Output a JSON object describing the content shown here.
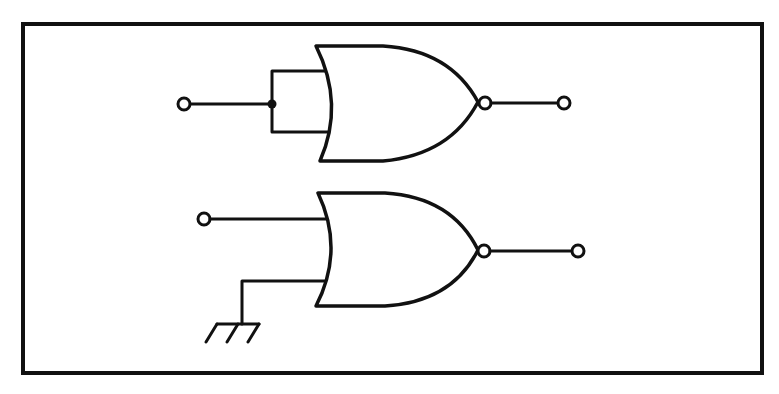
{
  "diagram": {
    "type": "logic-circuit",
    "colors": {
      "line": "#111111",
      "background": "#ffffff"
    },
    "gates": [
      {
        "id": "gate-1",
        "kind": "NOR",
        "inputs": "both inputs tied together to a single input terminal (junction dot)",
        "output": "inverted output to terminal"
      },
      {
        "id": "gate-2",
        "kind": "NOR",
        "inputs": "one input to terminal, other input tied to ground",
        "output": "inverted output to terminal"
      }
    ],
    "symbols": [
      "input-terminal",
      "output-terminal",
      "junction-dot",
      "ground-symbol",
      "inversion-bubble"
    ]
  }
}
